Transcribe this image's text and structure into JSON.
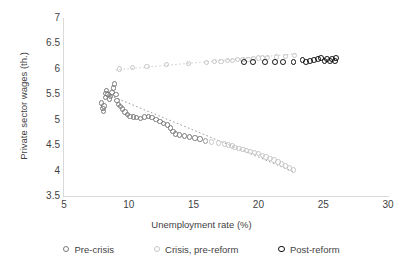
{
  "chart_data": {
    "type": "scatter",
    "title": "",
    "xlabel": "Unemployment rate (%)",
    "ylabel": "Private sector wages (th.)",
    "xlim": [
      5,
      30
    ],
    "ylim": [
      3.5,
      7
    ],
    "xticks": [
      "5",
      "10",
      "15",
      "20",
      "25",
      "30"
    ],
    "xtick_values": [
      5,
      10,
      15,
      20,
      25,
      30
    ],
    "yticks": [
      "3.5",
      "4",
      "4.5",
      "5",
      "5.5",
      "6",
      "6.5",
      "7"
    ],
    "ytick_values": [
      3.5,
      4,
      4.5,
      5,
      5.5,
      6,
      6.5,
      7
    ],
    "grid": false,
    "legend_position": "bottom",
    "series": [
      {
        "name": "Pre-crisis",
        "color": "#7a7a7a",
        "marker": "open-circle",
        "points": [
          [
            7.9,
            5.33
          ],
          [
            8.0,
            5.22
          ],
          [
            8.05,
            5.16
          ],
          [
            8.1,
            5.27
          ],
          [
            8.2,
            5.44
          ],
          [
            8.25,
            5.52
          ],
          [
            8.3,
            5.58
          ],
          [
            8.4,
            5.5
          ],
          [
            8.5,
            5.41
          ],
          [
            8.6,
            5.46
          ],
          [
            8.7,
            5.54
          ],
          [
            8.8,
            5.62
          ],
          [
            8.9,
            5.7
          ],
          [
            9.0,
            5.49
          ],
          [
            9.1,
            5.38
          ],
          [
            9.2,
            5.3
          ],
          [
            9.35,
            5.26
          ],
          [
            9.5,
            5.21
          ],
          [
            9.7,
            5.15
          ],
          [
            9.9,
            5.1
          ],
          [
            10.1,
            5.06
          ],
          [
            10.35,
            5.05
          ],
          [
            10.6,
            5.04
          ],
          [
            10.9,
            5.03
          ],
          [
            11.2,
            5.05
          ],
          [
            11.5,
            5.06
          ],
          [
            11.8,
            5.04
          ],
          [
            12.1,
            5.0
          ],
          [
            12.4,
            4.96
          ],
          [
            12.7,
            4.93
          ],
          [
            13.0,
            4.9
          ],
          [
            13.2,
            4.84
          ],
          [
            13.4,
            4.77
          ],
          [
            13.6,
            4.72
          ],
          [
            13.9,
            4.7
          ],
          [
            14.3,
            4.68
          ],
          [
            14.7,
            4.66
          ],
          [
            15.1,
            4.64
          ],
          [
            15.5,
            4.62
          ],
          [
            15.9,
            4.58
          ]
        ],
        "trendline": {
          "x0": 8.6,
          "y0": 5.47,
          "x1": 22.8,
          "y1": 3.97
        }
      },
      {
        "name": "Crisis, pre-reform",
        "color": "#c6c6c6",
        "marker": "open-circle",
        "points": [
          [
            9.3,
            6.0
          ],
          [
            10.3,
            6.03
          ],
          [
            11.4,
            6.05
          ],
          [
            12.9,
            6.08
          ],
          [
            14.6,
            6.11
          ],
          [
            16.0,
            6.13
          ],
          [
            16.6,
            6.14
          ],
          [
            17.1,
            6.15
          ],
          [
            17.6,
            6.16
          ],
          [
            18.0,
            6.17
          ],
          [
            18.4,
            6.18
          ],
          [
            18.8,
            6.19
          ],
          [
            19.2,
            6.19
          ],
          [
            19.6,
            6.2
          ],
          [
            20.0,
            6.21
          ],
          [
            20.3,
            6.21
          ],
          [
            20.7,
            6.22
          ],
          [
            21.4,
            6.23
          ],
          [
            22.1,
            6.24
          ],
          [
            22.8,
            6.26
          ],
          [
            15.9,
            4.58
          ],
          [
            16.4,
            4.56
          ],
          [
            16.9,
            4.54
          ],
          [
            17.4,
            4.52
          ],
          [
            17.7,
            4.5
          ],
          [
            18.0,
            4.48
          ],
          [
            18.2,
            4.45
          ],
          [
            18.5,
            4.43
          ],
          [
            18.8,
            4.41
          ],
          [
            19.1,
            4.39
          ],
          [
            19.4,
            4.37
          ],
          [
            19.7,
            4.35
          ],
          [
            20.0,
            4.33
          ],
          [
            20.3,
            4.3
          ],
          [
            20.6,
            4.27
          ],
          [
            20.9,
            4.24
          ],
          [
            21.2,
            4.21
          ],
          [
            21.5,
            4.17
          ],
          [
            21.8,
            4.13
          ],
          [
            22.1,
            4.09
          ],
          [
            22.4,
            4.05
          ],
          [
            22.7,
            4.01
          ]
        ],
        "trendline": {
          "x0": 9.0,
          "y0": 5.98,
          "x1": 23.0,
          "y1": 6.3
        }
      },
      {
        "name": "Post-reform",
        "color": "#111111",
        "marker": "open-circle-bold",
        "points": [
          [
            18.9,
            6.14
          ],
          [
            19.6,
            6.14
          ],
          [
            20.5,
            6.14
          ],
          [
            21.3,
            6.14
          ],
          [
            21.9,
            6.13
          ],
          [
            22.7,
            6.14
          ],
          [
            23.4,
            6.18
          ],
          [
            23.7,
            6.14
          ],
          [
            24.0,
            6.15
          ],
          [
            24.3,
            6.17
          ],
          [
            24.6,
            6.19
          ],
          [
            24.8,
            6.22
          ],
          [
            25.1,
            6.15
          ],
          [
            25.3,
            6.19
          ],
          [
            25.5,
            6.15
          ],
          [
            25.7,
            6.2
          ],
          [
            25.9,
            6.16
          ],
          [
            26.0,
            6.21
          ]
        ]
      }
    ]
  }
}
